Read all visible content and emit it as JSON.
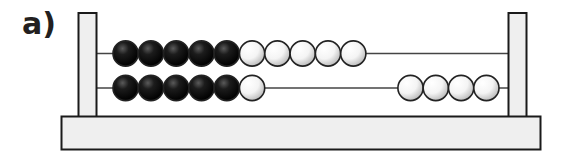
{
  "label": "a)",
  "colors": {
    "frame_fill": "#efefef",
    "frame_stroke": "#1a1a1a",
    "rod": "#444444",
    "bead_dark": "#111111",
    "bead_light": "#ffffff",
    "bead_stroke": "#222222"
  },
  "abacus": {
    "rods": [
      {
        "name": "top-rod",
        "beads_left": [
          {
            "color": "black"
          },
          {
            "color": "black"
          },
          {
            "color": "black"
          },
          {
            "color": "black"
          },
          {
            "color": "black"
          },
          {
            "color": "white"
          },
          {
            "color": "white"
          },
          {
            "color": "white"
          },
          {
            "color": "white"
          },
          {
            "color": "white"
          }
        ],
        "beads_right": []
      },
      {
        "name": "bottom-rod",
        "beads_left": [
          {
            "color": "black"
          },
          {
            "color": "black"
          },
          {
            "color": "black"
          },
          {
            "color": "black"
          },
          {
            "color": "black"
          },
          {
            "color": "white"
          }
        ],
        "beads_right": [
          {
            "color": "white"
          },
          {
            "color": "white"
          },
          {
            "color": "white"
          },
          {
            "color": "white"
          }
        ]
      }
    ],
    "counts": {
      "top_row_left": 10,
      "bottom_row_left": 6,
      "bottom_row_right": 4
    }
  }
}
